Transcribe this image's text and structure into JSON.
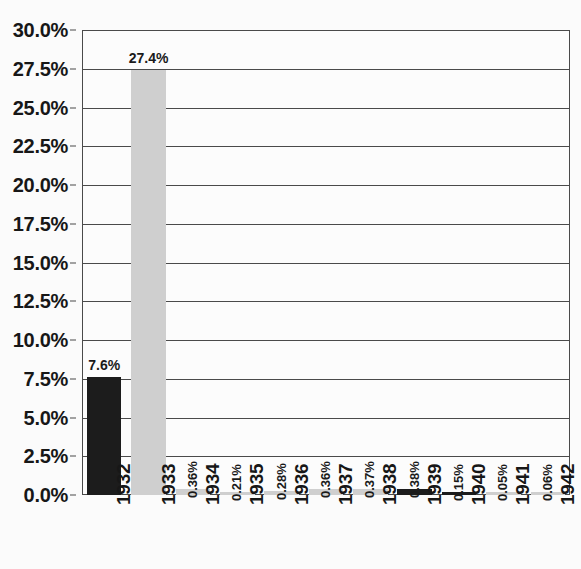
{
  "chart_data": {
    "type": "bar",
    "title": "",
    "xlabel": "",
    "ylabel": "",
    "ylim": [
      0,
      30
    ],
    "ytick_step": 2.5,
    "grid": true,
    "legend": "none",
    "categories": [
      "1932",
      "1933",
      "1934",
      "1935",
      "1936",
      "1937",
      "1938",
      "1939",
      "1940",
      "1941",
      "1942"
    ],
    "values": [
      7.6,
      27.4,
      0.36,
      0.21,
      0.28,
      0.36,
      0.37,
      0.38,
      0.15,
      0.05,
      0.06
    ],
    "value_labels": [
      "7.6%",
      "27.4%",
      "0.36%",
      "0.21%",
      "0.28%",
      "0.36%",
      "0.37%",
      "0.38%",
      "0.15%",
      "0.05%",
      "0.06%"
    ],
    "bar_colors": [
      "#1c1c1c",
      "#cfcfcf",
      "#cfcfcf",
      "#cfcfcf",
      "#cfcfcf",
      "#cfcfcf",
      "#cfcfcf",
      "#1c1c1c",
      "#1c1c1c",
      "#cfcfcf",
      "#cfcfcf"
    ],
    "ytick_labels": [
      "30.0%",
      "27.5%",
      "25.0%",
      "22.5%",
      "20.0%",
      "17.5%",
      "15.0%",
      "12.5%",
      "10.0%",
      "7.5%",
      "5.0%",
      "2.5%",
      "0.0%"
    ],
    "ytick_values": [
      30.0,
      27.5,
      25.0,
      22.5,
      20.0,
      17.5,
      15.0,
      12.5,
      10.0,
      7.5,
      5.0,
      2.5,
      0.0
    ]
  },
  "colors": {
    "axis": "#4a4a4a",
    "dark_bar": "#1c1c1c",
    "light_bar": "#cfcfcf",
    "background": "#fbfbfb",
    "text": "#171717"
  }
}
